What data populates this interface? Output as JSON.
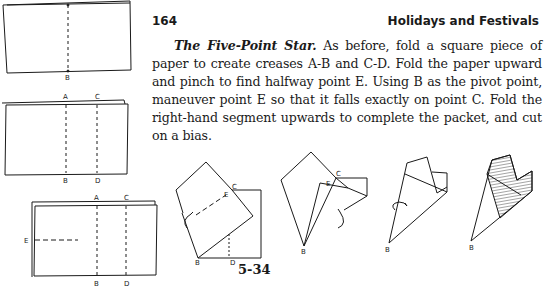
{
  "header": {
    "page_number": "164",
    "running_head": "Holidays and Festivals"
  },
  "section": {
    "title": "The Five-Point Star.",
    "body": " As before, fold a square piece of paper to create creases A-B and C-D. Fold the paper upward and pinch to find halfway point E. Using B as the pivot point, maneuver point E so that it falls exactly on point C. Fold the right-hand segment upwards to complete the packet, and cut on a bias."
  },
  "figure": {
    "label": "5-34",
    "step1": {
      "labels": [
        "B"
      ]
    },
    "step2": {
      "labels": [
        "A",
        "C",
        "B",
        "D"
      ]
    },
    "step3": {
      "labels": [
        "A",
        "C",
        "E",
        "B",
        "D"
      ]
    },
    "step4": {
      "labels": [
        "C",
        "E",
        "B",
        "D"
      ]
    },
    "step5": {
      "labels": [
        "C",
        "E",
        "B"
      ]
    },
    "step6": {
      "labels": [
        "B"
      ]
    },
    "step7": {
      "labels": [
        "B"
      ]
    }
  }
}
